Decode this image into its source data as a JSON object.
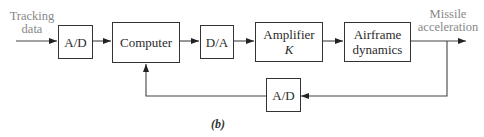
{
  "diagram": {
    "type": "block-diagram",
    "input_label": {
      "line1": "Tracking",
      "line2": "data"
    },
    "output_label": {
      "line1": "Missile",
      "line2": "acceleration"
    },
    "blocks": [
      {
        "id": "adc-forward",
        "label": "A/D"
      },
      {
        "id": "computer",
        "label": "Computer"
      },
      {
        "id": "dac",
        "label": "D/A"
      },
      {
        "id": "amplifier",
        "label": "Amplifier",
        "sublabel": "K"
      },
      {
        "id": "airframe",
        "label": "Airframe",
        "sublabel": "dynamics"
      },
      {
        "id": "adc-feedback",
        "label": "A/D"
      }
    ],
    "connections": [
      {
        "from": "input",
        "to": "adc-forward"
      },
      {
        "from": "adc-forward",
        "to": "computer"
      },
      {
        "from": "computer",
        "to": "dac"
      },
      {
        "from": "dac",
        "to": "amplifier"
      },
      {
        "from": "amplifier",
        "to": "airframe"
      },
      {
        "from": "airframe",
        "to": "output"
      },
      {
        "from": "output",
        "to": "adc-feedback"
      },
      {
        "from": "adc-feedback",
        "to": "computer"
      }
    ],
    "caption": "(b)",
    "colors": {
      "line": "#333333",
      "signal_text": "#888888"
    }
  }
}
